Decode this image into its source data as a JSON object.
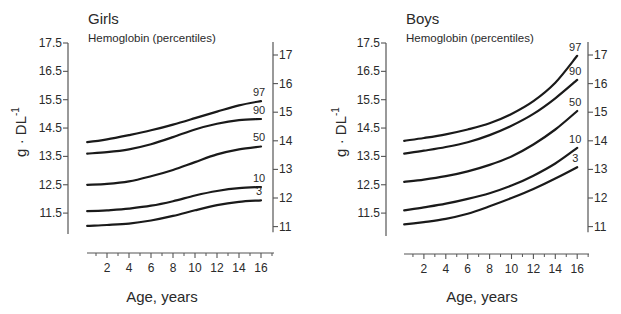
{
  "chart_data": [
    {
      "type": "line",
      "title": "Girls",
      "subtitle": "Hemoglobin (percentiles)",
      "xlabel": "Age,  years",
      "ylabel": "g · DL",
      "ylabel_superscript": "-1",
      "x_ticks": [
        2,
        4,
        6,
        8,
        10,
        12,
        14,
        16
      ],
      "x_minor_ticks": [
        1,
        3,
        5,
        7,
        9,
        11,
        13,
        15,
        17
      ],
      "xlim": [
        0,
        17
      ],
      "y_left_ticks": [
        "17.5",
        "16.5",
        "15.5",
        "14.5",
        "13.5",
        "12.5",
        "11.5"
      ],
      "y_left_values": [
        17.5,
        16.5,
        15.5,
        14.5,
        13.5,
        12.5,
        11.5
      ],
      "y_right_ticks": [
        "17",
        "16",
        "15",
        "14",
        "13",
        "12",
        "11"
      ],
      "y_right_values": [
        17,
        16,
        15,
        14,
        13,
        12,
        11
      ],
      "ylim": [
        10.8,
        17.5
      ],
      "grid": false,
      "legend": "inline labels at line ends",
      "x": [
        0.2,
        2,
        4,
        6,
        8,
        10,
        12,
        14,
        16
      ],
      "series": [
        {
          "name": "97",
          "values": [
            14.0,
            14.1,
            14.25,
            14.42,
            14.62,
            14.85,
            15.08,
            15.3,
            15.45
          ]
        },
        {
          "name": "90",
          "values": [
            13.6,
            13.65,
            13.75,
            13.93,
            14.18,
            14.45,
            14.65,
            14.78,
            14.82
          ]
        },
        {
          "name": "50",
          "values": [
            12.5,
            12.53,
            12.62,
            12.8,
            13.02,
            13.3,
            13.57,
            13.75,
            13.85
          ]
        },
        {
          "name": "10",
          "values": [
            11.57,
            11.6,
            11.66,
            11.76,
            11.92,
            12.12,
            12.28,
            12.38,
            12.42
          ]
        },
        {
          "name": "3",
          "values": [
            11.05,
            11.08,
            11.13,
            11.24,
            11.4,
            11.6,
            11.78,
            11.9,
            11.95
          ]
        }
      ]
    },
    {
      "type": "line",
      "title": "Boys",
      "subtitle": "Hemoglobin (percentiles)",
      "xlabel": "Age,  years",
      "ylabel": "g · DL",
      "ylabel_superscript": "-1",
      "x_ticks": [
        2,
        4,
        6,
        8,
        10,
        12,
        14,
        16
      ],
      "x_minor_ticks": [
        1,
        3,
        5,
        7,
        9,
        11,
        13,
        15,
        17
      ],
      "xlim": [
        0,
        17
      ],
      "y_left_ticks": [
        "17.5",
        "16.5",
        "15.5",
        "14.5",
        "13.5",
        "12.5",
        "11.5"
      ],
      "y_left_values": [
        17.5,
        16.5,
        15.5,
        14.5,
        13.5,
        12.5,
        11.5
      ],
      "y_right_ticks": [
        "17",
        "16",
        "15",
        "14",
        "13",
        "12",
        "11"
      ],
      "y_right_values": [
        17,
        16,
        15,
        14,
        13,
        12,
        11
      ],
      "ylim": [
        10.8,
        17.5
      ],
      "grid": false,
      "legend": "inline labels at line ends",
      "x": [
        0.2,
        2,
        4,
        6,
        8,
        10,
        12,
        14,
        16
      ],
      "series": [
        {
          "name": "97",
          "values": [
            14.05,
            14.15,
            14.28,
            14.45,
            14.67,
            15.0,
            15.45,
            16.1,
            17.05
          ]
        },
        {
          "name": "90",
          "values": [
            13.6,
            13.7,
            13.83,
            14.0,
            14.25,
            14.58,
            15.0,
            15.55,
            16.2
          ]
        },
        {
          "name": "50",
          "values": [
            12.6,
            12.68,
            12.8,
            12.97,
            13.2,
            13.5,
            13.92,
            14.45,
            15.1
          ]
        },
        {
          "name": "10",
          "values": [
            11.6,
            11.7,
            11.83,
            12.0,
            12.2,
            12.47,
            12.82,
            13.25,
            13.8
          ]
        },
        {
          "name": "3",
          "values": [
            11.1,
            11.18,
            11.3,
            11.48,
            11.74,
            12.03,
            12.35,
            12.72,
            13.12
          ]
        }
      ]
    }
  ],
  "panels": [
    {
      "title": "Girls",
      "subtitle": "Hemoglobin (percentiles)",
      "xlabel": "Age,  years",
      "ylabel": "g · DL",
      "ylabel_sup": "-1"
    },
    {
      "title": "Boys",
      "subtitle": "Hemoglobin (percentiles)",
      "xlabel": "Age,  years",
      "ylabel": "g · DL",
      "ylabel_sup": "-1"
    }
  ],
  "colors": {
    "line": "#1a1a1a",
    "axis": "#555555",
    "text": "#2a2a2a",
    "background": "#ffffff"
  }
}
